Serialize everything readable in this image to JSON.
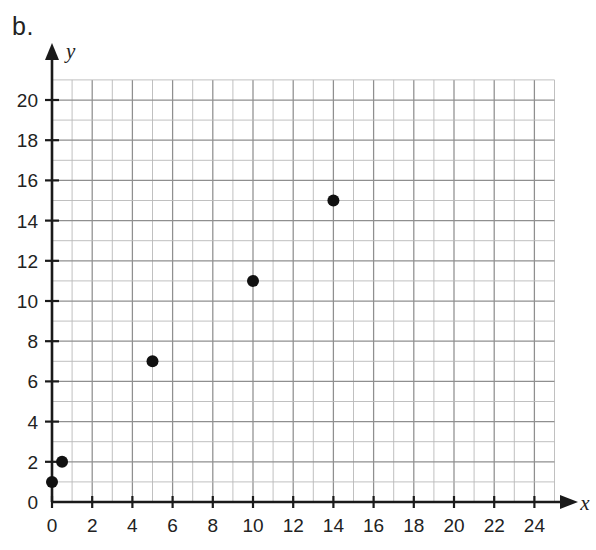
{
  "figure": {
    "label": "b."
  },
  "chart_data": {
    "type": "scatter",
    "title": "",
    "xlabel": "x",
    "ylabel": "y",
    "xlim": [
      0,
      25
    ],
    "ylim": [
      0,
      21
    ],
    "grid": true,
    "grid_step": 1,
    "legend": "none",
    "x_ticks": [
      0,
      2,
      4,
      6,
      8,
      10,
      12,
      14,
      16,
      18,
      20,
      22,
      24
    ],
    "y_ticks": [
      0,
      2,
      4,
      6,
      8,
      10,
      12,
      14,
      16,
      18,
      20
    ],
    "x_tick_labels": [
      "0",
      "2",
      "4",
      "6",
      "8",
      "10",
      "12",
      "14",
      "16",
      "18",
      "20",
      "22",
      "24"
    ],
    "y_tick_labels": [
      "0",
      "2",
      "4",
      "6",
      "8",
      "10",
      "12",
      "14",
      "16",
      "18",
      "20"
    ],
    "points": [
      {
        "x": 0,
        "y": 1
      },
      {
        "x": 0.5,
        "y": 2
      },
      {
        "x": 5,
        "y": 7
      },
      {
        "x": 10,
        "y": 11
      },
      {
        "x": 14,
        "y": 15
      }
    ],
    "marker": {
      "shape": "circle",
      "radius": 6,
      "color": "#111111"
    },
    "colors": {
      "axis": "#1a1a1a",
      "grid_minor": "#b9b9b9",
      "grid_major": "#8f8f8f",
      "text": "#222222",
      "background": "#ffffff"
    }
  }
}
